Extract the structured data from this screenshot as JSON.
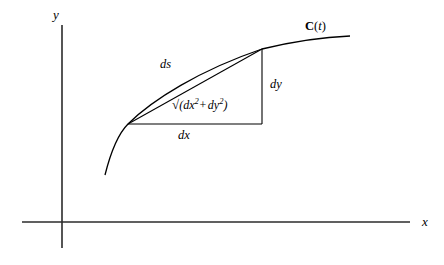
{
  "figure": {
    "background_color": "#ffffff",
    "stroke_color": "#000000"
  },
  "axes": {
    "x_label": "x",
    "y_label": "y",
    "origin": {
      "x": 62,
      "y": 222
    },
    "x_axis": {
      "x1": 22,
      "y1": 222,
      "x2": 410,
      "y2": 222
    },
    "y_axis": {
      "x1": 62,
      "y1": 25,
      "x2": 62,
      "y2": 248
    }
  },
  "curve": {
    "label_text": "C(t)",
    "label_bold_part": "C",
    "label_paren_open": "(",
    "label_italic_part": "t",
    "label_paren_close": ")",
    "path": "M 105 175 C 111 151, 118 134, 128 124 C 152 100, 200 70, 262 49 C 295 41, 325 37, 350 36",
    "start_point": {
      "x": 105,
      "y": 175
    },
    "end_point": {
      "x": 350,
      "y": 36
    }
  },
  "triangle": {
    "left_vertex": {
      "x": 128,
      "y": 124
    },
    "top_vertex": {
      "x": 262,
      "y": 49
    },
    "right_angle_corner": {
      "x": 262,
      "y": 124
    },
    "hypotenuse_label": "√(dx² + dy²)",
    "vertical_leg_label": "dy",
    "horizontal_leg_label": "dx",
    "arc_label": "ds"
  },
  "labels": {
    "ds": "ds",
    "dy": "dy",
    "dx": "dx",
    "sqrt_radical": "√",
    "sqrt_open": "(",
    "sqrt_dx": "dx",
    "sqrt_exp1": "2",
    "sqrt_plus": "+",
    "sqrt_dy": "dy",
    "sqrt_exp2": "2",
    "sqrt_close": ")"
  }
}
